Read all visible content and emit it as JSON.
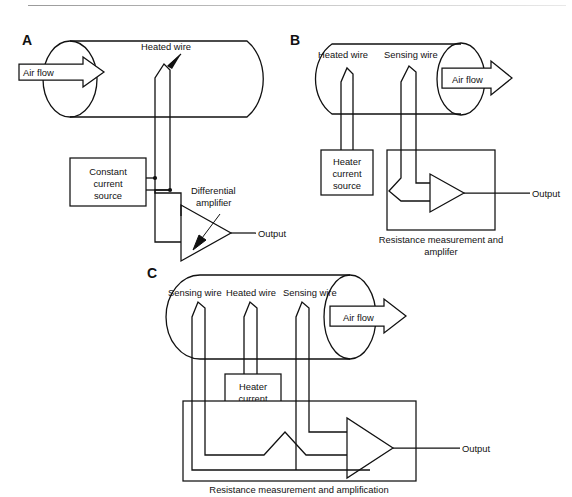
{
  "figure": {
    "background": "#ffffff",
    "ink": "#111111"
  },
  "panels": [
    {
      "id": "A",
      "letter": "A",
      "labels": {
        "air_flow": "Air flow",
        "heated_wire": "Heated wire",
        "source_line1": "Constant",
        "source_line2": "current",
        "source_line3": "source",
        "amp_line1": "Differential",
        "amp_line2": "amplifier",
        "output": "Output"
      },
      "flow_direction": "into-tube-left-end",
      "wires": [
        "heated-wire"
      ]
    },
    {
      "id": "B",
      "letter": "B",
      "labels": {
        "air_flow": "Air flow",
        "heated_wire": "Heated wire",
        "sensing_wire": "Sensing wire",
        "heater_line1": "Heater",
        "heater_line2": "current",
        "heater_line3": "source",
        "measure_line1": "Resistance measurement and",
        "measure_line2": "amplifer",
        "output": "Output"
      },
      "flow_direction": "out-of-tube-right-end",
      "wires": [
        "heated-wire",
        "sensing-wire"
      ]
    },
    {
      "id": "C",
      "letter": "C",
      "labels": {
        "air_flow": "Air flow",
        "sensing_wire_left": "Sensing wire",
        "heated_wire": "Heated wire",
        "sensing_wire_right": "Sensing wire",
        "heater_line1": "Heater",
        "heater_line2": "current",
        "heater_line3": "source",
        "measure_caption": "Resistance measurement and amplification",
        "output": "Output"
      },
      "flow_direction": "out-of-tube-right-end",
      "wires": [
        "sensing-wire",
        "heated-wire",
        "sensing-wire"
      ]
    }
  ]
}
